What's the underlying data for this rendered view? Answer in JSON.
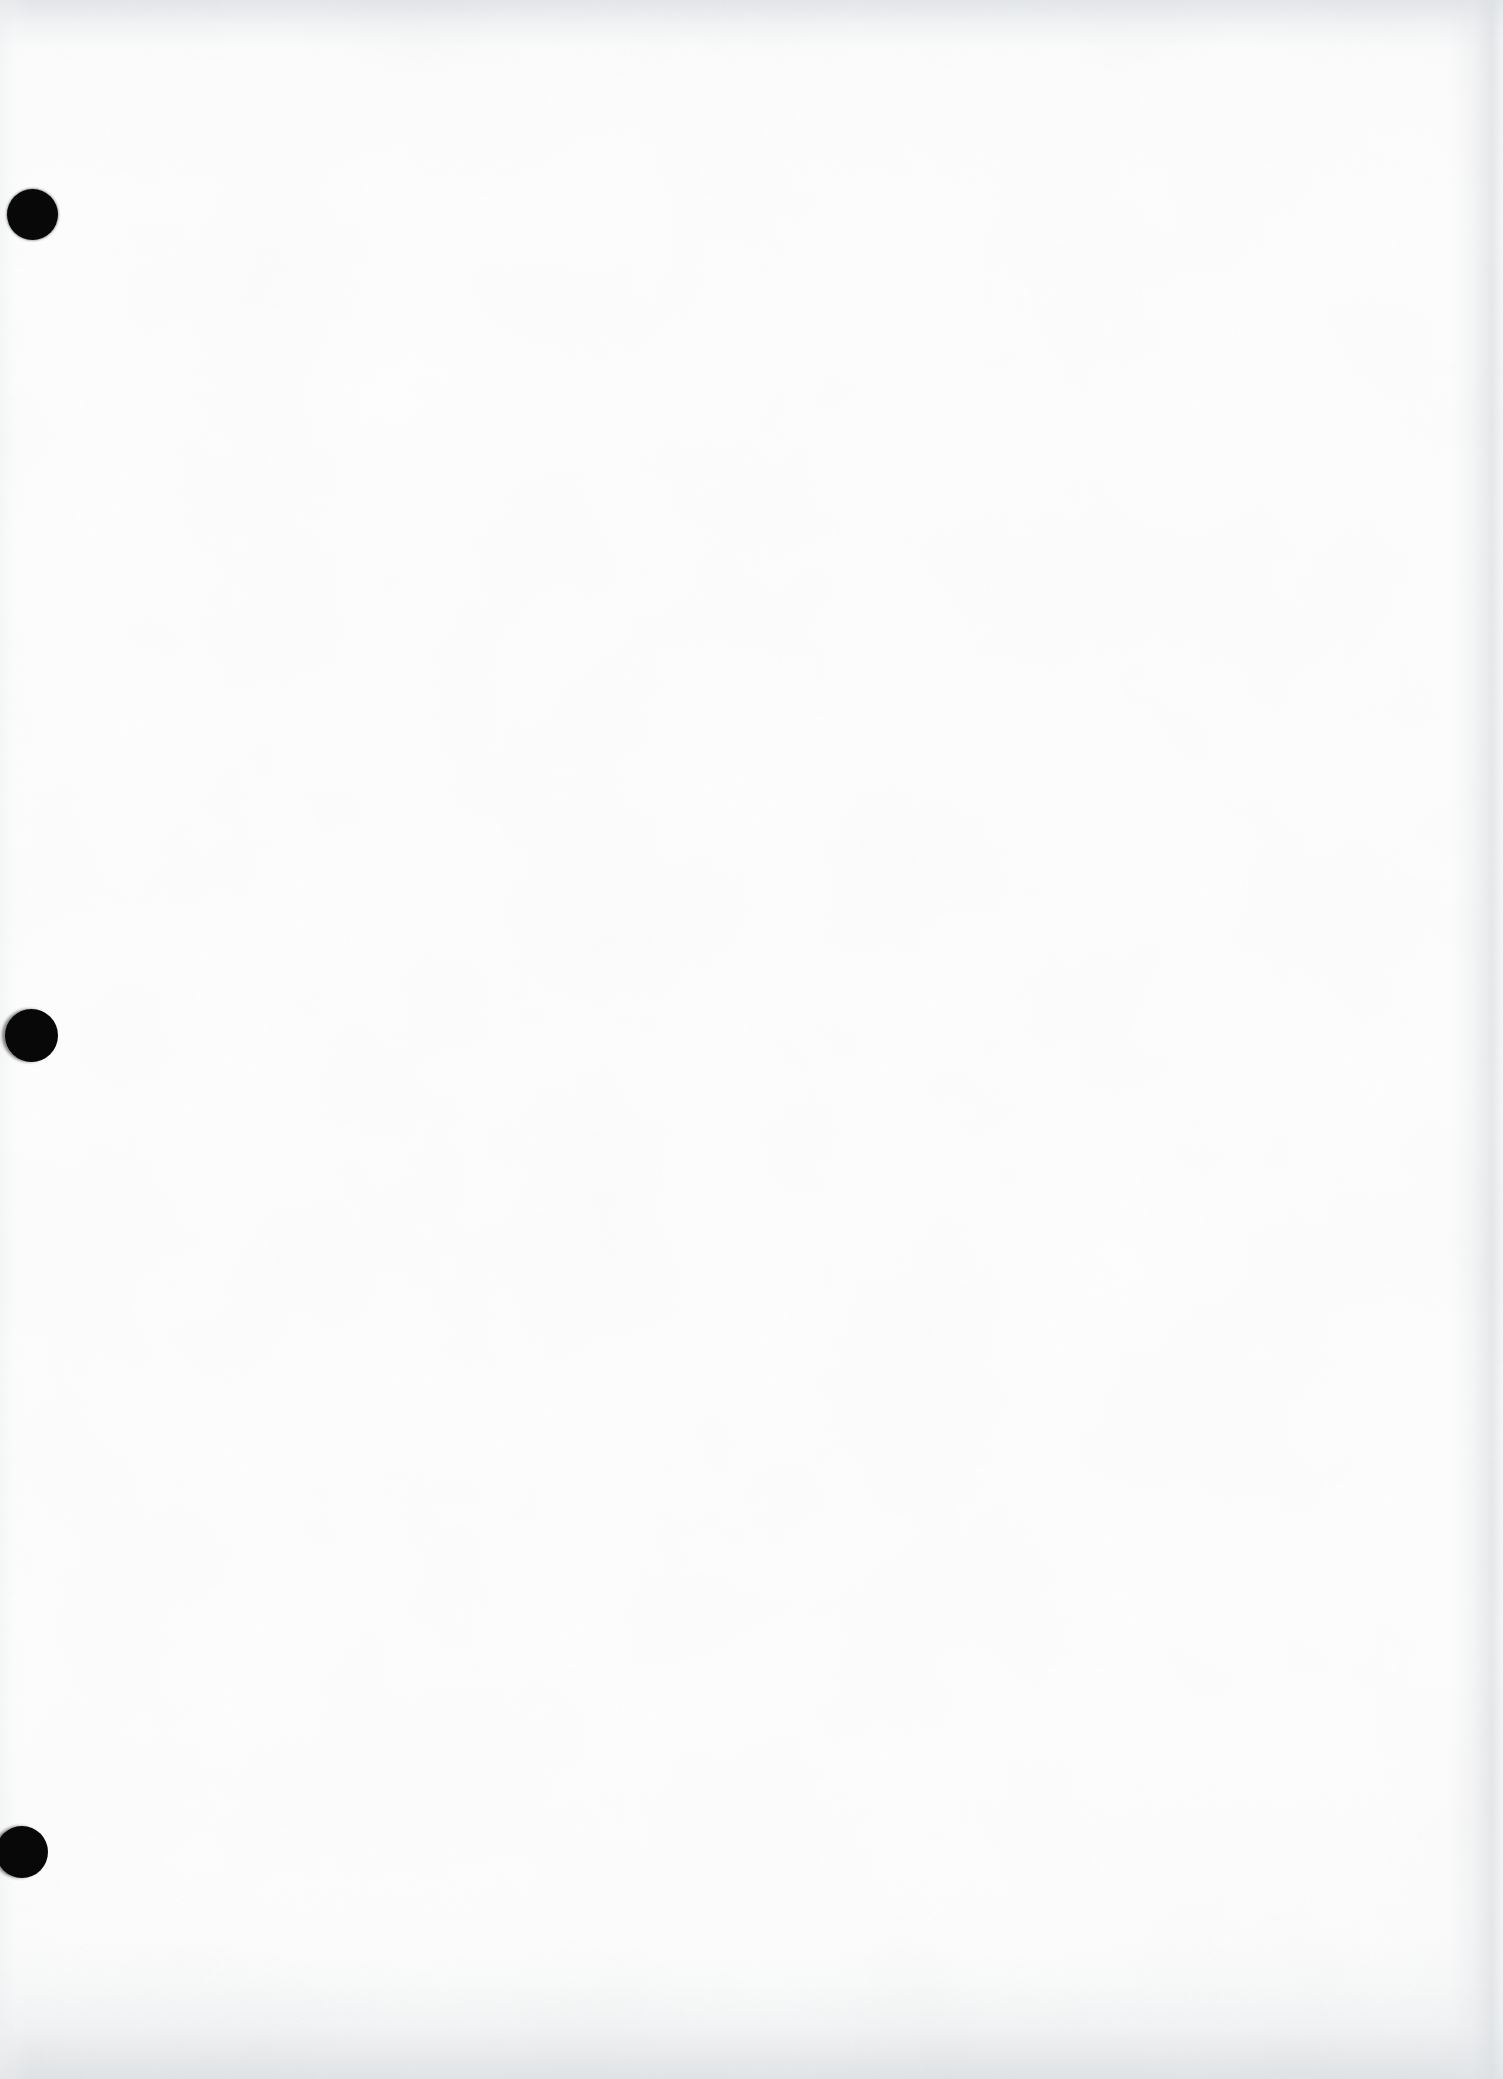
{
  "document": {
    "kind": "scanned-page",
    "title": "Scanned blank page",
    "page_width": 1503,
    "page_height": 2079,
    "orientation": "portrait",
    "content_text": "",
    "visible_text_present": false,
    "description": "Blank scanned sheet of paper with three black binder punch holes along the left edge"
  },
  "paper": {
    "base_color": "#fefefe",
    "tint_color": "#fdfdfd",
    "grain_color": "#f2f3f4",
    "edge_shadow_color": "#e0e3e6",
    "top_shadow_color": "#e1e4e7",
    "bottom_shadow_color": "#dee1e4",
    "right_shadow_color": "#dfe2e5"
  },
  "punch_holes": {
    "count": 3,
    "color": "#080808",
    "halo_color": "#a0a2a5",
    "items": [
      {
        "label": "top punch hole",
        "name": "punch-hole-top",
        "center_x": 32,
        "center_y": 214,
        "diameter": 51,
        "clipped": false
      },
      {
        "label": "middle punch hole",
        "name": "punch-hole-middle",
        "center_x": 31,
        "center_y": 1035,
        "diameter": 53,
        "clipped": true
      },
      {
        "label": "bottom punch hole",
        "name": "punch-hole-bottom",
        "center_x": 22,
        "center_y": 1852,
        "diameter": 52,
        "clipped": true
      }
    ]
  }
}
